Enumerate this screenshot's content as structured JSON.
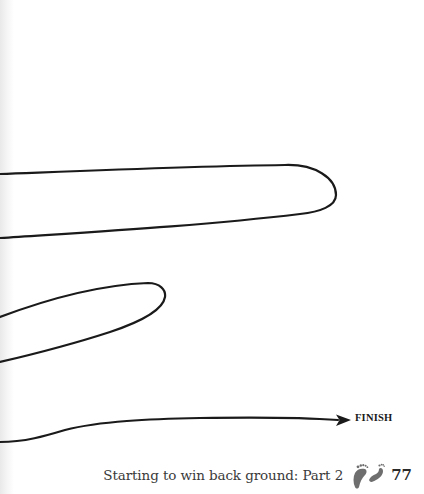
{
  "page": {
    "background": "#ffffff",
    "line_color": "#1a1a1a"
  },
  "maze": {
    "end_label": "FINISH"
  },
  "footer": {
    "running_head": "Starting to win back ground: Part 2",
    "icon": "footprints-icon",
    "icon_color": "#6e6e6e",
    "page_number": "77"
  }
}
